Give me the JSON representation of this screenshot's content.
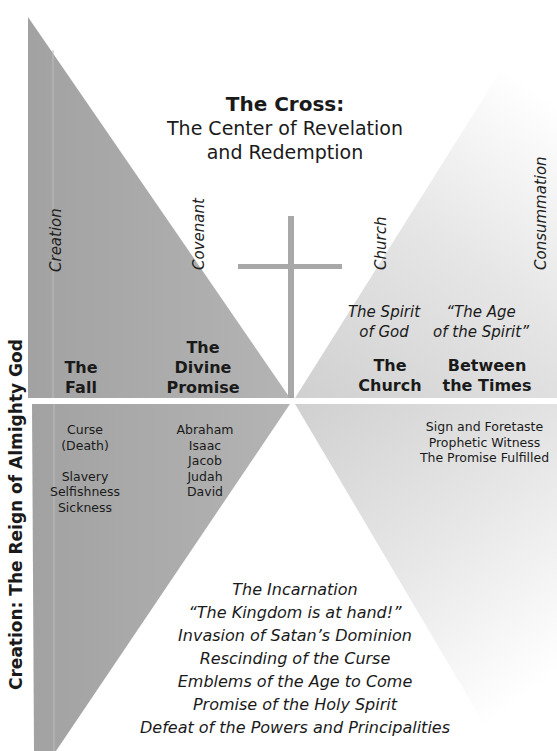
{
  "title": {
    "line1": "The Cross:",
    "line2": "The Center of Revelation",
    "line3": "and Redemption"
  },
  "side_label": "Creation: The Reign of Almighty God",
  "eras": [
    {
      "label": "Creation"
    },
    {
      "label": "Covenant"
    },
    {
      "label": "Church"
    },
    {
      "label": "Consummation"
    }
  ],
  "upper": {
    "fall": {
      "line1": "The",
      "line2": "Fall"
    },
    "divine_promise": {
      "line1": "The",
      "line2": "Divine",
      "line3": "Promise"
    },
    "spirit_of_god": {
      "line1": "The Spirit",
      "line2": "of God"
    },
    "age_of_spirit": {
      "line1": "“The Age",
      "line2": "of the Spirit”"
    },
    "church": {
      "line1": "The",
      "line2": "Church"
    },
    "between_times": {
      "line1": "Between",
      "line2": "the Times"
    }
  },
  "lower": {
    "fall_items": [
      "Curse",
      "(Death)",
      "",
      "Slavery",
      "Selfishness",
      "Sickness"
    ],
    "promise_items": [
      "Abraham",
      "Isaac",
      "Jacob",
      "Judah",
      "David"
    ],
    "church_items": [
      "Sign and Foretaste",
      "Prophetic Witness",
      "The Promise Fulfilled"
    ],
    "incarnation_items": [
      "The Incarnation",
      "“The Kingdom is at hand!”",
      "Invasion of Satan’s Dominion",
      "Rescinding of the Curse",
      "Emblems of the Age to Come",
      "Promise of the Holy Spirit",
      "Defeat of the Powers and Principalities"
    ]
  },
  "colors": {
    "dark_gray": "#a6a6a6",
    "light_gray": "#dcdcdc",
    "cross": "#a8a8a8",
    "text": "#1a1a1a"
  }
}
